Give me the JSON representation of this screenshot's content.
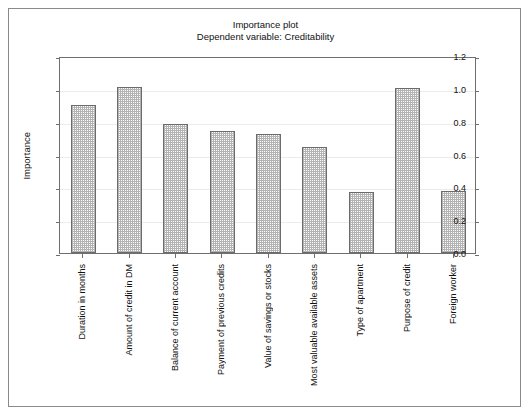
{
  "chart_data": {
    "type": "bar",
    "title": "Importance plot",
    "subtitle": "Dependent variable: Creditability",
    "xlabel": "",
    "ylabel": "Importance",
    "ylim": [
      0.0,
      1.2
    ],
    "yticks": [
      "0.0",
      "0.2",
      "0.4",
      "0.6",
      "0.8",
      "1.0",
      "1.2"
    ],
    "ytick_values": [
      0.0,
      0.2,
      0.4,
      0.6,
      0.8,
      1.0,
      1.2
    ],
    "grid": true,
    "legend": "none",
    "categories": [
      "Duration in months",
      "Amount of credit in DM",
      "Balance of current account",
      "Payment of previous credits",
      "Value of savings or stocks",
      "Most valuable available assets",
      "Type of apartment",
      "Purpose of credit",
      "Foreign worker"
    ],
    "values": [
      0.9,
      1.01,
      0.785,
      0.745,
      0.725,
      0.645,
      0.37,
      1.005,
      0.38
    ],
    "bar_fill": "#b3b3b3",
    "bar_edge": "#6b6b6b"
  }
}
